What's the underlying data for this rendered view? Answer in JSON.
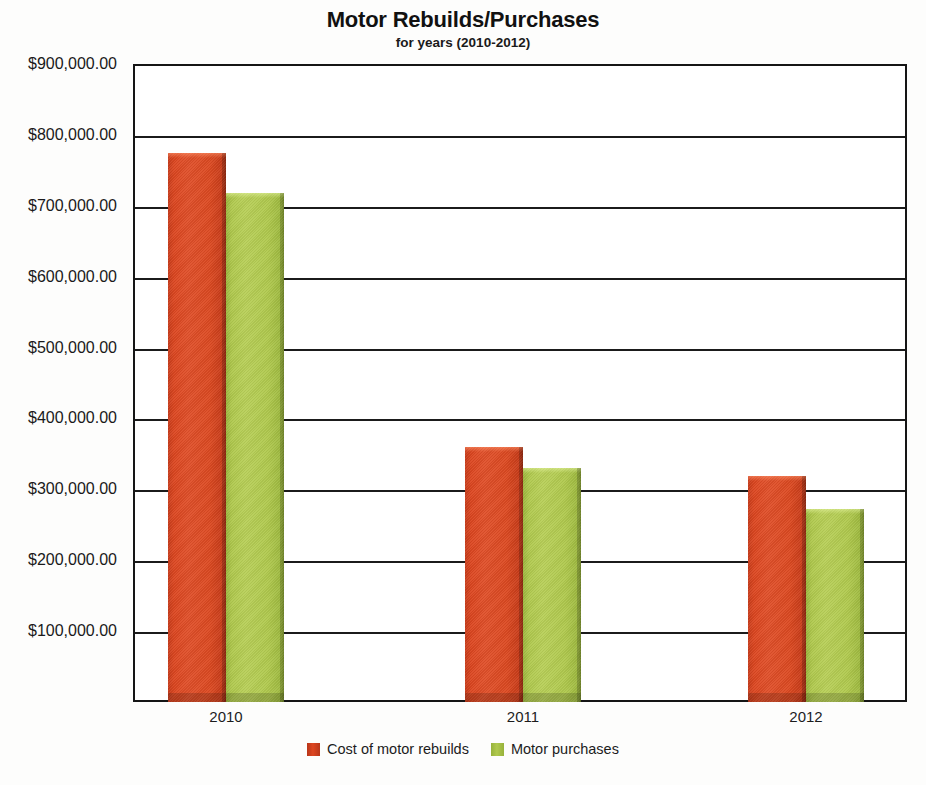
{
  "chart_data": {
    "type": "bar",
    "title": "Motor Rebuilds/Purchases",
    "subtitle": "for years (2010-2012)",
    "xlabel": "",
    "ylabel": "",
    "categories": [
      "2010",
      "2011",
      "2012"
    ],
    "series": [
      {
        "name": "Cost of motor rebuilds",
        "color": "#dd4621",
        "values": [
          774000,
          360000,
          319000
        ]
      },
      {
        "name": "Motor purchases",
        "color": "#b0c94e",
        "values": [
          718000,
          330000,
          272000
        ]
      }
    ],
    "ylim": [
      0,
      900000
    ],
    "ytick_values": [
      100000,
      200000,
      300000,
      400000,
      500000,
      600000,
      700000,
      800000,
      900000
    ],
    "ytick_labels": [
      "$100,000.00",
      "$200,000.00",
      "$300,000.00",
      "$400,000.00",
      "$500,000.00",
      "$600,000.00",
      "$700,000.00",
      "$800,000.00",
      "$900,000.00"
    ],
    "grid": true,
    "grid_axis": "y",
    "legend_position": "bottom",
    "plot_background": "#ffffff",
    "axis_color": "#1b1b1b"
  },
  "legend": {
    "items": [
      {
        "label": "Cost of motor rebuilds",
        "swatch": "red"
      },
      {
        "label": "Motor purchases",
        "swatch": "green"
      }
    ]
  }
}
